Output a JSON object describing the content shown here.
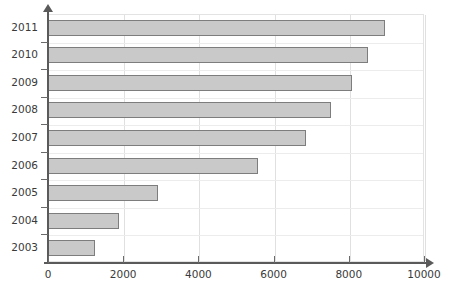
{
  "chart_data": {
    "type": "bar",
    "orientation": "horizontal",
    "title": "",
    "xlabel": "",
    "ylabel": "",
    "categories": [
      "2003",
      "2004",
      "2005",
      "2006",
      "2007",
      "2008",
      "2009",
      "2010",
      "2011"
    ],
    "values": [
      1260,
      1880,
      2930,
      5590,
      6860,
      7530,
      8090,
      8520,
      8950
    ],
    "xlim": [
      0,
      10000
    ],
    "xticks": [
      0,
      2000,
      4000,
      6000,
      8000,
      10000
    ],
    "xtick_labels": [
      "0",
      "2000",
      "4000",
      "6000",
      "8000",
      "10000"
    ],
    "ytick_labels": [
      "2011",
      "2010",
      "2009",
      "2008",
      "2007",
      "2006",
      "2005",
      "2004",
      "2003"
    ],
    "grid": true,
    "legend": "none",
    "series": [
      {
        "name": "",
        "bar_fill": "#c9c9c9",
        "bar_border": "#7d7d7d",
        "points": [
          {
            "category": "2011",
            "value": 8950
          },
          {
            "category": "2010",
            "value": 8520
          },
          {
            "category": "2009",
            "value": 8090
          },
          {
            "category": "2008",
            "value": 7530
          },
          {
            "category": "2007",
            "value": 6860
          },
          {
            "category": "2006",
            "value": 5590
          },
          {
            "category": "2005",
            "value": 2930
          },
          {
            "category": "2004",
            "value": 1880
          },
          {
            "category": "2003",
            "value": 1260
          }
        ]
      }
    ]
  },
  "style": {
    "axis_color": "#5a5a5a",
    "grid_color": "#e0e0e0",
    "plot_background": "#ffffff",
    "page_background": "#ffffff",
    "tick_label_color": "#3a3a3a"
  }
}
